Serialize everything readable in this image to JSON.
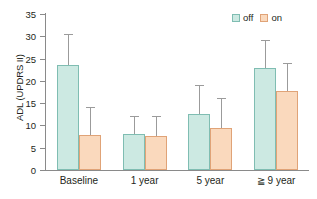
{
  "chart_data": {
    "type": "bar",
    "title": "",
    "xlabel": "",
    "ylabel": "ADL (UPDRS II)",
    "categories": [
      "Baseline",
      "1 year",
      "5 year",
      "≧ 9 year"
    ],
    "series": [
      {
        "name": "off",
        "color": "#cce9e2",
        "border": "#7fbdb2",
        "values": [
          23.5,
          8.1,
          12.5,
          22.9
        ],
        "errors_upper": [
          30.6,
          12.2,
          19.0,
          29.2
        ]
      },
      {
        "name": "on",
        "color": "#fad9bd",
        "border": "#e0a377",
        "values": [
          7.8,
          7.6,
          9.4,
          17.7
        ],
        "errors_upper": [
          14.1,
          12.2,
          16.2,
          24.0
        ]
      }
    ],
    "ylim": [
      0,
      35
    ],
    "yticks": [
      0,
      5,
      10,
      15,
      20,
      25,
      30,
      35
    ],
    "ytick_labels": [
      "0",
      "5",
      "10",
      "15",
      "20",
      "25",
      "30",
      "35"
    ],
    "grid": false,
    "legend": {
      "position": "top-right",
      "entries": [
        {
          "label": "off",
          "color": "#cce9e2"
        },
        {
          "label": "on",
          "color": "#fad9bd"
        }
      ]
    },
    "errorbar_style": "upper-only-with-cap",
    "errorbar_color": "#9b9b9b",
    "axis_color": "#8a8a8a",
    "background": "#ffffff"
  }
}
